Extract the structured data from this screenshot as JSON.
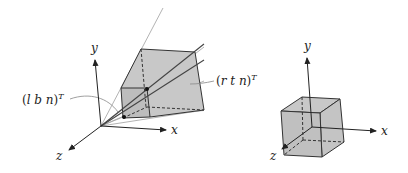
{
  "figure": {
    "left": {
      "title": "perspective view frustum",
      "axes": {
        "x": "x",
        "y": "y",
        "z": "z"
      },
      "label_near_bottom_left": {
        "open": "(",
        "body": "l b n",
        "close": ")",
        "sup": "T"
      },
      "label_far_top_right": {
        "open": "(",
        "body": "r t n",
        "close": ")",
        "sup": "T"
      }
    },
    "right": {
      "title": "canonical view volume cube",
      "axes": {
        "x": "x",
        "y": "y",
        "z": "z"
      }
    },
    "colors": {
      "fill": "#c8c8c8",
      "stroke": "#333333",
      "ray": "#9a9a9a",
      "text": "#222222"
    }
  }
}
